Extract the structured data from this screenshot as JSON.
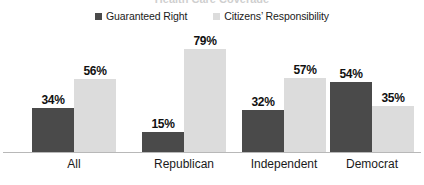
{
  "chart_data": {
    "type": "bar",
    "title": "",
    "xlabel": "",
    "ylabel": "",
    "ylim": [
      0,
      100
    ],
    "grid": false,
    "legend_position": "top-center",
    "value_suffix": "%",
    "categories": [
      "All",
      "Republican",
      "Independent",
      "Democrat"
    ],
    "series": [
      {
        "name": "Guaranteed Right",
        "color": "#4a4a4a",
        "values": [
          34,
          15,
          32,
          54
        ],
        "labels": [
          "34%",
          "15%",
          "32%",
          "54%"
        ]
      },
      {
        "name": "Citizens’ Responsibility",
        "color": "#dcdcdc",
        "values": [
          56,
          79,
          57,
          35
        ],
        "labels": [
          "56%",
          "79%",
          "57%",
          "35%"
        ]
      }
    ]
  },
  "legend": {
    "items": [
      {
        "label": "Guaranteed Right",
        "color": "#4a4a4a"
      },
      {
        "label": "Citizens’ Responsibility",
        "color": "#dcdcdc"
      }
    ]
  },
  "axis": {
    "baseline_color": "#b8b8b8"
  },
  "title_sliver": {
    "text": "Health Care Coverage"
  }
}
